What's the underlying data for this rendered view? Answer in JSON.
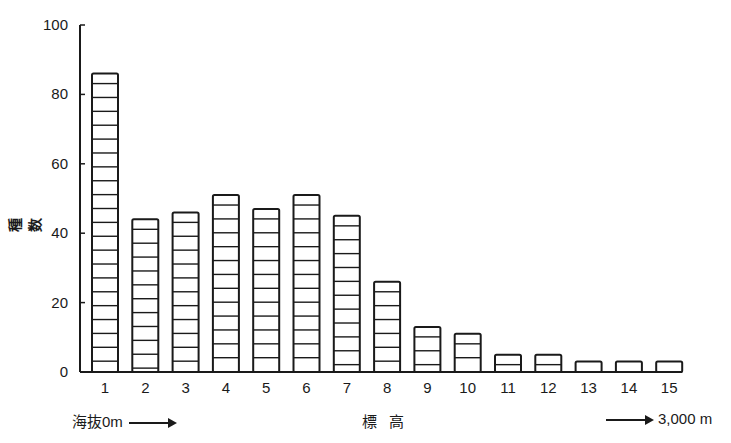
{
  "chart_data": {
    "type": "bar",
    "title": "",
    "xlabel": "標 高",
    "ylabel": "種 数",
    "categories": [
      "1",
      "2",
      "3",
      "4",
      "5",
      "6",
      "7",
      "8",
      "9",
      "10",
      "11",
      "12",
      "13",
      "14",
      "15"
    ],
    "values": [
      86,
      44,
      46,
      51,
      47,
      51,
      45,
      26,
      13,
      11,
      5,
      5,
      3,
      3,
      3
    ],
    "ylim": [
      0,
      100
    ],
    "yticks": [
      0,
      20,
      40,
      60,
      80,
      100
    ],
    "grid": false,
    "legend": null,
    "bar_style": "white bars with black outline and horizontal stripes",
    "annotations": {
      "left": "海抜0m",
      "right": "3,000 m"
    }
  },
  "colors": {
    "ink": "#1a1a1a",
    "background": "#ffffff"
  }
}
